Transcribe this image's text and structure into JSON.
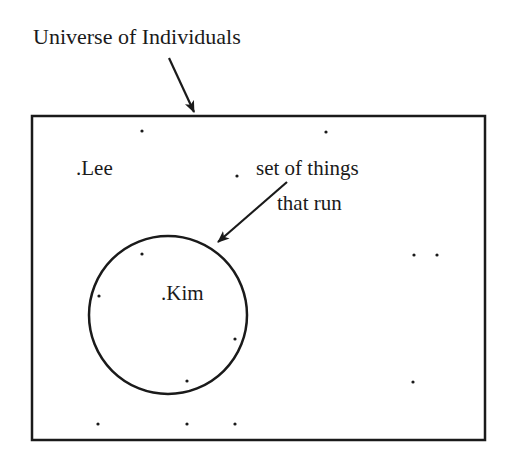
{
  "diagram": {
    "title": "Universe of Individuals",
    "set_label_line1": "set of things",
    "set_label_line2": "that run",
    "individuals": {
      "lee": ".Lee",
      "kim": ".Kim"
    },
    "colors": {
      "stroke": "#1a1a1a",
      "background": "#ffffff"
    }
  }
}
